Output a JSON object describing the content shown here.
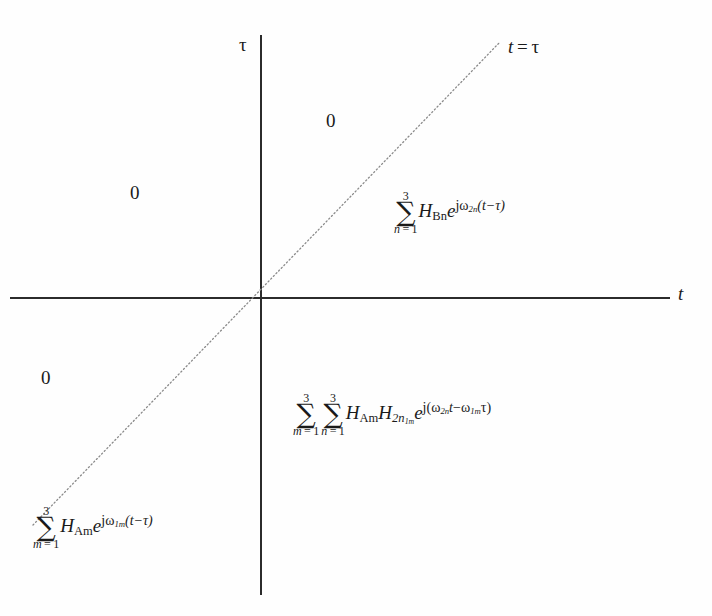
{
  "figure": {
    "type": "math-plane-diagram",
    "background_color": "#fefefe",
    "line_color": "#2b2b2b",
    "diagonal_style": "dotted"
  },
  "axes": {
    "horizontal": {
      "label": "t",
      "label_style": "italic"
    },
    "vertical": {
      "label": "τ",
      "label_style": "upright"
    },
    "origin": {
      "x": 261,
      "y": 298
    }
  },
  "diagonal": {
    "label_t": "t",
    "label_eq": " = ",
    "label_tau": "τ",
    "label_full": "t = τ",
    "start": {
      "x": 33,
      "y": 525
    },
    "end": {
      "x": 500,
      "y": 42
    }
  },
  "regions": {
    "zero_top": {
      "value": "0"
    },
    "zero_left": {
      "value": "0"
    },
    "zero_bottom_left": {
      "value": "0"
    },
    "upper_right": {
      "latex": "\\sum_{n=1}^{3} H_{\\mathrm{Bn}} e^{j\\omega_{2n}(t-\\tau)}",
      "sum_upper": "3",
      "sum_lower_index": "n",
      "sum_lower_eq": " = 1",
      "coefficient_base": "H",
      "coefficient_sub": "Bn",
      "exp_base": "e",
      "exp_j": "j",
      "exp_omega": "ω",
      "exp_omega_sub": "2n",
      "exp_arg": "(t−τ)"
    },
    "lower_right": {
      "latex": "\\sum_{m=1}^{3}\\sum_{n=1}^{3} H_{\\mathrm{Am}} H_{2n_{1m}} e^{j(\\omega_{2n}t-\\omega_{1m}\\tau)}",
      "sum1_upper": "3",
      "sum1_lower_index": "m",
      "sum1_lower_eq": " = 1",
      "sum2_upper": "3",
      "sum2_lower_index": "n",
      "sum2_lower_eq": " = 1",
      "coeff1_base": "H",
      "coeff1_sub": "Am",
      "coeff2_base": "H",
      "coeff2_sub": "2n",
      "coeff2_subsub": "1m",
      "exp_base": "e",
      "exp_j": "j",
      "exp_open": "(",
      "exp_omega1": "ω",
      "exp_omega1_sub": "2n",
      "exp_var1": "t",
      "exp_minus": "−",
      "exp_omega2": "ω",
      "exp_omega2_sub": "1m",
      "exp_var2": "τ",
      "exp_close": ")"
    },
    "lower_left": {
      "latex": "\\sum_{m=1}^{3} H_{\\mathrm{Am}} e^{j\\omega_{1m}(t-\\tau)}",
      "sum_upper": "3",
      "sum_lower_index": "m",
      "sum_lower_eq": " = 1",
      "coefficient_base": "H",
      "coefficient_sub": "Am",
      "exp_base": "e",
      "exp_j": "j",
      "exp_omega": "ω",
      "exp_omega_sub": "1m",
      "exp_arg": "(t−τ)"
    }
  }
}
